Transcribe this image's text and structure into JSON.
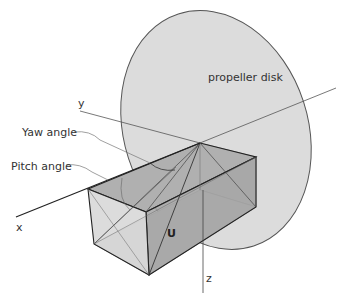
{
  "diagram": {
    "labels": {
      "propeller_disk": "propeller disk",
      "y_axis": "y",
      "x_axis": "x",
      "z_axis": "z",
      "yaw_angle": "Yaw angle",
      "pitch_angle": "Pitch angle",
      "velocity_vector": "U"
    },
    "colors": {
      "disk_fill": "#dcdcdc",
      "box_dark": "#a8a8a8",
      "box_mid": "#bdbdbd",
      "box_light": "#d6d6d6",
      "line": "#222222",
      "thin_line": "#555555"
    }
  }
}
